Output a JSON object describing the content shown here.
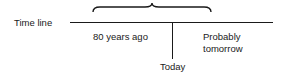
{
  "diagram": {
    "axis_label": "Time line",
    "past_label": "80 years ago",
    "present_label": "Today",
    "future_label_line1": "Probably",
    "future_label_line2": "tomorrow",
    "colors": {
      "ink": "#1a1a1a",
      "background": "#ffffff"
    }
  }
}
